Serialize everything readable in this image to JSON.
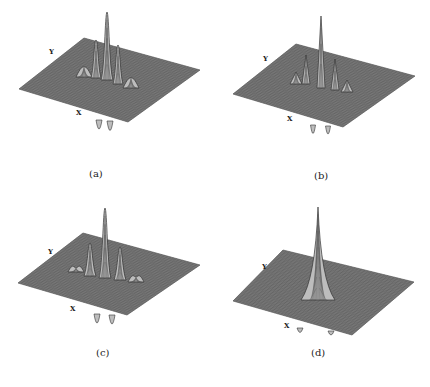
{
  "figure": {
    "panels": [
      {
        "id": "a",
        "caption": "(a)",
        "caption_pos": [
          98,
          173
        ],
        "axis_x_label": "X",
        "axis_y_label": "Y",
        "x_label_pos": [
          76,
          144
        ],
        "y_label_pos": [
          49,
          54
        ],
        "plane": {
          "left": [
            19,
            89
          ],
          "top": [
            84,
            38
          ],
          "right": [
            200,
            70
          ],
          "bottom": [
            128,
            122
          ]
        },
        "peaks": [
          {
            "x": 107,
            "base": 80,
            "top": 12,
            "w": 6
          },
          {
            "x": 96,
            "base": 78,
            "top": 40,
            "w": 5
          },
          {
            "x": 118,
            "base": 84,
            "top": 45,
            "w": 5
          },
          {
            "x": 84,
            "base": 77,
            "top": 67,
            "w": 8
          },
          {
            "x": 131,
            "base": 88,
            "top": 78,
            "w": 8
          }
        ],
        "dips": [
          {
            "x": 99,
            "base": 120,
            "bottom": 134,
            "w": 3
          },
          {
            "x": 110,
            "base": 121,
            "bottom": 136,
            "w": 3
          }
        ],
        "style": "smooth"
      },
      {
        "id": "b",
        "caption": "(b)",
        "caption_pos": [
          323,
          175
        ],
        "axis_x_label": "X",
        "axis_y_label": "Y",
        "x_label_pos": [
          287,
          127
        ],
        "y_label_pos": [
          263,
          60
        ],
        "plane": {
          "left": [
            233,
            94
          ],
          "top": [
            296,
            44
          ],
          "right": [
            415,
            76
          ],
          "bottom": [
            343,
            127
          ]
        },
        "peaks": [
          {
            "x": 321,
            "base": 88,
            "top": 16,
            "w": 4
          },
          {
            "x": 306,
            "base": 84,
            "top": 55,
            "w": 4
          },
          {
            "x": 335,
            "base": 90,
            "top": 59,
            "w": 4
          },
          {
            "x": 296,
            "base": 84,
            "top": 72,
            "w": 6
          },
          {
            "x": 347,
            "base": 92,
            "top": 80,
            "w": 6
          }
        ],
        "dips": [
          {
            "x": 313,
            "base": 125,
            "bottom": 138,
            "w": 2.5
          },
          {
            "x": 328,
            "base": 126,
            "bottom": 138,
            "w": 2.5
          }
        ],
        "style": "spiky"
      },
      {
        "id": "c",
        "caption": "(c)",
        "caption_pos": [
          105,
          352
        ],
        "axis_x_label": "X",
        "axis_y_label": "Y",
        "x_label_pos": [
          70,
          310
        ],
        "y_label_pos": [
          48,
          253
        ],
        "plane": {
          "left": [
            18,
            283
          ],
          "top": [
            83,
            233
          ],
          "right": [
            200,
            265
          ],
          "bottom": [
            127,
            315
          ]
        },
        "peaks": [
          {
            "x": 105,
            "base": 278,
            "top": 208,
            "w": 6
          },
          {
            "x": 90,
            "base": 276,
            "top": 243,
            "w": 6
          },
          {
            "x": 120,
            "base": 280,
            "top": 247,
            "w": 6
          },
          {
            "x": 76,
            "base": 272,
            "top": 268,
            "w": 8
          },
          {
            "x": 136,
            "base": 282,
            "top": 277,
            "w": 8
          }
        ],
        "dips": [
          {
            "x": 97,
            "base": 314,
            "bottom": 328,
            "w": 3
          },
          {
            "x": 112,
            "base": 315,
            "bottom": 329,
            "w": 3
          }
        ],
        "style": "smooth"
      },
      {
        "id": "d",
        "caption": "(d)",
        "caption_pos": [
          320,
          352
        ],
        "axis_x_label": "X",
        "axis_y_label": "Y",
        "x_label_pos": [
          284,
          327
        ],
        "y_label_pos": [
          262,
          268
        ],
        "plane": {
          "left": [
            233,
            301
          ],
          "top": [
            283,
            250
          ],
          "right": [
            414,
            282
          ],
          "bottom": [
            352,
            335
          ]
        },
        "peaks": [
          {
            "x": 318,
            "base": 300,
            "top": 207,
            "w": 11
          }
        ],
        "dips": [
          {
            "x": 300,
            "base": 328,
            "bottom": 333,
            "w": 3
          },
          {
            "x": 331,
            "base": 331,
            "bottom": 335,
            "w": 3
          }
        ],
        "style": "cone"
      }
    ]
  },
  "colors": {
    "plane": "#7a7a7a",
    "grid": "#555555",
    "peak_fill": "#bdbdbd",
    "peak_stroke": "#333333",
    "text": "#222222"
  }
}
